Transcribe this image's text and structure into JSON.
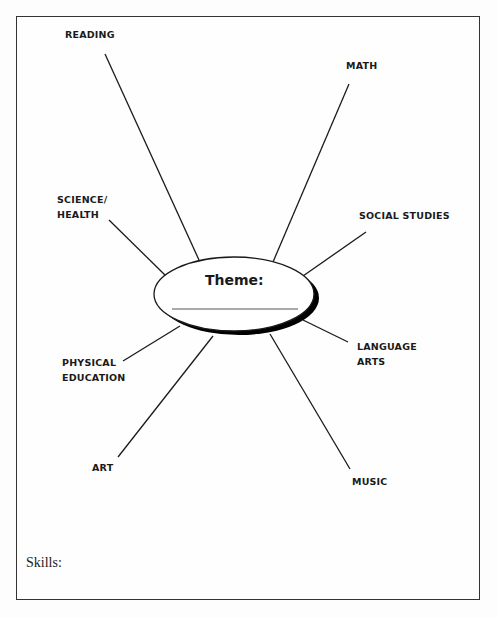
{
  "center": {
    "label": "Theme:",
    "blank_line": true
  },
  "subjects": [
    {
      "id": "reading",
      "lines": [
        "READING"
      ]
    },
    {
      "id": "math",
      "lines": [
        "MATH"
      ]
    },
    {
      "id": "science-health",
      "lines": [
        "SCIENCE/",
        "HEALTH"
      ]
    },
    {
      "id": "social-studies",
      "lines": [
        "SOCIAL STUDIES"
      ]
    },
    {
      "id": "language-arts",
      "lines": [
        "LANGUAGE",
        "ARTS"
      ]
    },
    {
      "id": "physical-education",
      "lines": [
        "PHYSICAL",
        "EDUCATION"
      ]
    },
    {
      "id": "art",
      "lines": [
        "ART"
      ]
    },
    {
      "id": "music",
      "lines": [
        "MUSIC"
      ]
    }
  ],
  "footer": {
    "skills_label": "Skills:"
  },
  "colors": {
    "line": "#1a1a1a",
    "border": "#333333",
    "shadow": "#000000"
  }
}
